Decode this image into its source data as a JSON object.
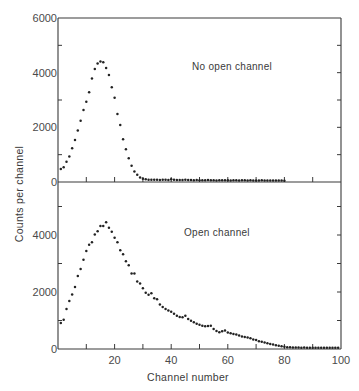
{
  "figure": {
    "xlabel": "Channel number",
    "ylabel": "Counts per channel",
    "colors": {
      "axis": "#3a3a3a",
      "points": "#222222",
      "text": "#4a4a4a",
      "background": "#ffffff"
    }
  },
  "chart_data": [
    {
      "type": "scatter",
      "panel": "upper",
      "annotation": "No open channel",
      "xlabel": "Channel number",
      "ylabel": "Counts per channel",
      "xlim": [
        0,
        100
      ],
      "ylim": [
        0,
        6000
      ],
      "y_tick_labels": [
        "0",
        "2000",
        "4000",
        "6000"
      ],
      "y_minor_ticks": [
        1000,
        3000,
        5000
      ],
      "x_ticks": [
        10,
        20,
        30,
        40,
        50,
        60,
        70,
        80,
        90
      ],
      "x_tick_labels": [],
      "grid": false,
      "series": [
        {
          "name": "No open channel",
          "x": [
            1,
            2,
            3,
            4,
            5,
            6,
            7,
            8,
            9,
            10,
            11,
            12,
            13,
            14,
            15,
            16,
            17,
            18,
            19,
            20,
            21,
            22,
            23,
            24,
            25,
            26,
            27,
            28,
            29,
            30,
            31,
            32,
            33,
            34,
            35,
            36,
            37,
            38,
            39,
            40,
            41,
            42,
            43,
            44,
            45,
            46,
            47,
            48,
            49,
            50,
            51,
            52,
            53,
            54,
            55,
            56,
            57,
            58,
            59,
            60,
            61,
            62,
            63,
            64,
            65,
            66,
            67,
            68,
            69,
            70,
            71,
            72,
            73,
            74,
            75,
            76,
            77,
            78,
            79,
            80
          ],
          "y": [
            440,
            500,
            700,
            900,
            1200,
            1500,
            1850,
            2200,
            2600,
            2900,
            3250,
            3750,
            4100,
            4300,
            4370,
            4340,
            4130,
            3880,
            3430,
            3050,
            2450,
            2050,
            1530,
            1160,
            830,
            560,
            350,
            230,
            130,
            80,
            60,
            50,
            50,
            45,
            45,
            40,
            50,
            45,
            40,
            60,
            45,
            40,
            40,
            35,
            45,
            40,
            35,
            30,
            35,
            30,
            30,
            25,
            35,
            30,
            25,
            20,
            30,
            25,
            30,
            25,
            20,
            30,
            25,
            20,
            25,
            30,
            20,
            25,
            20,
            15,
            20,
            25,
            20,
            15,
            20,
            15,
            20,
            15,
            15,
            10
          ]
        }
      ]
    },
    {
      "type": "scatter",
      "panel": "lower",
      "annotation": "Open channel",
      "xlabel": "Channel number",
      "ylabel": "Counts per channel",
      "xlim": [
        0,
        100
      ],
      "ylim": [
        0,
        6000
      ],
      "y_tick_labels": [
        "0",
        "2000",
        "4000"
      ],
      "y_minor_ticks": [
        1000,
        3000,
        5000
      ],
      "x_ticks": [
        10,
        20,
        30,
        40,
        50,
        60,
        70,
        80,
        90
      ],
      "x_tick_labels": [
        "20",
        "40",
        "60",
        "80",
        "100"
      ],
      "grid": false,
      "series": [
        {
          "name": "Open channel",
          "x": [
            1,
            2,
            3,
            4,
            5,
            6,
            7,
            8,
            9,
            10,
            11,
            12,
            13,
            14,
            15,
            16,
            17,
            18,
            19,
            20,
            21,
            22,
            23,
            24,
            25,
            26,
            27,
            28,
            29,
            30,
            31,
            32,
            33,
            34,
            35,
            36,
            37,
            38,
            39,
            40,
            41,
            42,
            43,
            44,
            45,
            46,
            47,
            48,
            49,
            50,
            51,
            52,
            53,
            54,
            55,
            56,
            57,
            58,
            59,
            60,
            61,
            62,
            63,
            64,
            65,
            66,
            67,
            68,
            69,
            70,
            71,
            72,
            73,
            74,
            75,
            76,
            77,
            78,
            79,
            80,
            81,
            82,
            83,
            84,
            85,
            86,
            87,
            88,
            89,
            90,
            91,
            92,
            93,
            94,
            95,
            96,
            97,
            98,
            99
          ],
          "y": [
            880,
            990,
            1370,
            1650,
            1880,
            2140,
            2530,
            2770,
            3100,
            3400,
            3620,
            3710,
            3980,
            4100,
            4280,
            4280,
            4410,
            4220,
            4080,
            3870,
            3710,
            3430,
            3290,
            3040,
            2900,
            2610,
            2610,
            2330,
            2260,
            2100,
            1940,
            1870,
            1920,
            1750,
            1710,
            1530,
            1440,
            1370,
            1320,
            1270,
            1200,
            1130,
            1090,
            1080,
            1130,
            1020,
            960,
            900,
            850,
            820,
            780,
            760,
            770,
            780,
            670,
            600,
            550,
            590,
            610,
            540,
            520,
            490,
            470,
            440,
            400,
            390,
            370,
            340,
            300,
            280,
            240,
            220,
            190,
            170,
            140,
            120,
            100,
            80,
            60,
            40,
            30,
            25,
            20,
            15,
            15,
            10,
            15,
            10,
            10,
            10,
            5,
            10,
            5,
            5,
            10,
            5,
            5,
            5,
            5
          ]
        }
      ]
    }
  ]
}
